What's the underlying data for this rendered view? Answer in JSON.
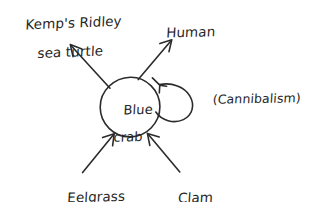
{
  "diagram": {
    "background_color": "#ffffff",
    "ink_color": "#2b2b2b",
    "style": "hand-drawn pen sketch",
    "center_node": {
      "name": "blue-crab",
      "label_line1": "Blue",
      "label_line2": "crab",
      "shape": "circle"
    },
    "self_loop": {
      "name": "cannibalism-loop",
      "annotation": "(Cannibalism)",
      "direction": "returns to blue crab"
    },
    "predators": [
      {
        "name": "kemps-ridley-sea-turtle",
        "label_line1": "Kemp's Ridley",
        "label_line2": "sea turtle",
        "arrow_direction": "from blue crab to predator, up-left"
      },
      {
        "name": "human",
        "label_line1": "Human",
        "label_line2": "",
        "arrow_direction": "from blue crab to predator, up-right"
      }
    ],
    "prey": [
      {
        "name": "eelgrass",
        "label_line1": "Eelgrass",
        "label_line2": "",
        "arrow_direction": "from prey to blue crab, up-right"
      },
      {
        "name": "clam",
        "label_line1": "Clam",
        "label_line2": "",
        "arrow_direction": "from prey to blue crab, up-left"
      }
    ]
  }
}
